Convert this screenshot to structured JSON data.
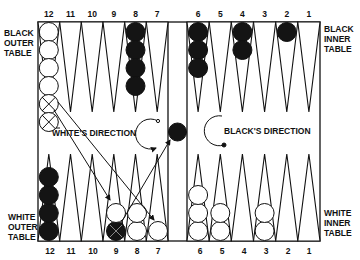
{
  "colors": {
    "ink": "#111111",
    "background": "#ffffff",
    "black_checker": "#141414",
    "white_checker": "#ffffff"
  },
  "top_point_numbers": [
    "12",
    "11",
    "10",
    "9",
    "8",
    "7",
    "6",
    "5",
    "4",
    "3",
    "2",
    "1"
  ],
  "bottom_point_numbers": [
    "12",
    "11",
    "10",
    "9",
    "8",
    "7",
    "6",
    "5",
    "4",
    "3",
    "2",
    "1"
  ],
  "side_labels": {
    "top_left": [
      "BLACK",
      "OUTER",
      "TABLE"
    ],
    "top_right": [
      "BLACK",
      "INNER",
      "TABLE"
    ],
    "bottom_left": [
      "WHITE",
      "OUTER",
      "TABLE"
    ],
    "bottom_right": [
      "WHITE",
      "INNER",
      "TABLE"
    ]
  },
  "direction_labels": {
    "white": "WHITE'S DIRECTION",
    "black": "BLACK'S DIRECTION"
  },
  "checkers": {
    "top": [
      {
        "point": "12",
        "color": "white",
        "count": 6,
        "crossed": [
          4,
          5
        ]
      },
      {
        "point": "8",
        "color": "black",
        "count": 4
      },
      {
        "point": "6",
        "color": "black",
        "count": 3
      },
      {
        "point": "4",
        "color": "black",
        "count": 2
      },
      {
        "point": "2",
        "color": "black",
        "count": 1
      }
    ],
    "bottom": [
      {
        "point": "12",
        "color": "black",
        "count": 4
      },
      {
        "point": "9",
        "color": "white",
        "count": 1,
        "extra_black_crossed": 1
      },
      {
        "point": "8",
        "color": "white",
        "count": 2
      },
      {
        "point": "7",
        "color": "white",
        "count": 1
      },
      {
        "point": "6",
        "color": "white",
        "count": 3
      },
      {
        "point": "5",
        "color": "white",
        "count": 2
      },
      {
        "point": "3",
        "color": "white",
        "count": 2
      }
    ],
    "bar": [
      {
        "color": "black",
        "count": 1
      }
    ]
  }
}
